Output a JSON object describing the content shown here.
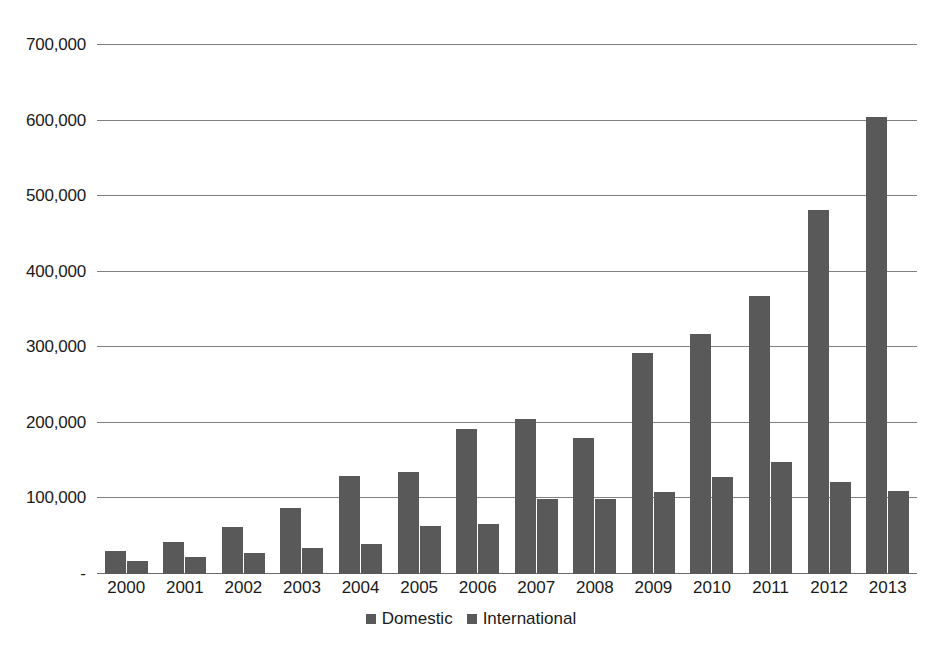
{
  "chart_data": {
    "type": "bar",
    "title": "",
    "subtitle": "",
    "xlabel": "",
    "ylabel": "",
    "categories": [
      "2000",
      "2001",
      "2002",
      "2003",
      "2004",
      "2005",
      "2006",
      "2007",
      "2008",
      "2009",
      "2010",
      "2011",
      "2012",
      "2013"
    ],
    "series": [
      {
        "name": "Domestic",
        "color": "#595959",
        "values": [
          31000,
          42000,
          62000,
          88000,
          130000,
          135000,
          192000,
          205000,
          180000,
          293000,
          317000,
          368000,
          482000,
          605000
        ]
      },
      {
        "name": "International",
        "color": "#595959",
        "values": [
          17000,
          22000,
          28000,
          34000,
          40000,
          64000,
          66000,
          99000,
          99000,
          108000,
          128000,
          148000,
          122000,
          110000
        ]
      }
    ],
    "ylim": [
      0,
      700000
    ],
    "yticks": [
      0,
      100000,
      200000,
      300000,
      400000,
      500000,
      600000,
      700000
    ],
    "ytick_labels": [
      "-",
      "100,000",
      "200,000",
      "300,000",
      "400,000",
      "500,000",
      "600,000",
      "700,000"
    ],
    "grid": true,
    "grid_axis": "y",
    "legend_position": "bottom",
    "bar_color": "#595959",
    "gridline_color": "#808080",
    "background_color": "#ffffff",
    "text_color": "#1a1a1a"
  },
  "legend": {
    "items": [
      {
        "label": "Domestic",
        "swatch": "legend-swatch-domestic"
      },
      {
        "label": "International",
        "swatch": "legend-swatch-international"
      }
    ]
  }
}
